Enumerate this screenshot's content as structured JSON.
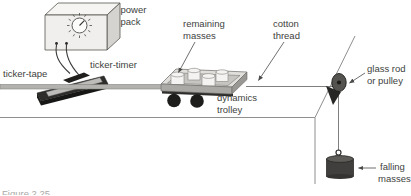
{
  "figure_caption": "Figure 2.25",
  "colors": {
    "background": "#ffffff",
    "bench_line": "#8f8f8d",
    "label_text": "#403f3d",
    "caption_text": "#a9a8a6",
    "device_dark": "#2c2b29",
    "tape_gray": "#b3b2af",
    "thread": "#71706e"
  },
  "labels": {
    "power_pack": [
      "power",
      "pack"
    ],
    "remaining_masses": [
      "remaining",
      "masses"
    ],
    "cotton_thread": [
      "cotton",
      "thread"
    ],
    "ticker_tape": "ticker-tape",
    "ticker_timer": "ticker-timer",
    "dynamics_trolley": [
      "dynamics",
      "trolley"
    ],
    "glass_rod_or_pulley": [
      "glass rod",
      "or pulley"
    ],
    "falling_masses": [
      "falling",
      "masses"
    ]
  }
}
